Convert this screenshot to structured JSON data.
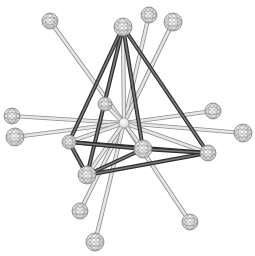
{
  "diagram": {
    "title": "",
    "colors": {
      "background": "#ffffff",
      "frame_edge": "#4a4a4a",
      "frame_edge_light": "#7a7a7a",
      "rod_fill": "#e6e6e6",
      "rod_stroke": "#8c8c8c",
      "sphere_fill": "#f4f4f4",
      "sphere_mesh": "#7d7d7d"
    },
    "center": {
      "x": 124,
      "y": 123
    },
    "frame_vertices": [
      {
        "id": "B",
        "x": 123,
        "y": 27,
        "r": 9
      },
      {
        "id": "K",
        "x": 87,
        "y": 175,
        "r": 9
      },
      {
        "id": "J",
        "x": 208,
        "y": 153,
        "r": 8
      },
      {
        "id": "I",
        "x": 143,
        "y": 149,
        "r": 9
      },
      {
        "id": "O",
        "x": 69,
        "y": 142,
        "r": 7
      }
    ],
    "frame_edges": [
      [
        "B",
        "K"
      ],
      [
        "B",
        "O"
      ],
      [
        "B",
        "J"
      ],
      [
        "B",
        "I"
      ],
      [
        "K",
        "J"
      ],
      [
        "O",
        "J"
      ],
      [
        "K",
        "O"
      ],
      [
        "O",
        "I"
      ],
      [
        "K",
        "I"
      ],
      [
        "I",
        "J"
      ]
    ],
    "radial_spheres": [
      {
        "id": "A",
        "x": 50,
        "y": 21,
        "r": 8
      },
      {
        "id": "C",
        "x": 149,
        "y": 15,
        "r": 8
      },
      {
        "id": "D",
        "x": 173,
        "y": 22,
        "r": 9
      },
      {
        "id": "E",
        "x": 12,
        "y": 116,
        "r": 8
      },
      {
        "id": "F",
        "x": 15,
        "y": 137,
        "r": 9
      },
      {
        "id": "G",
        "x": 213,
        "y": 111,
        "r": 8
      },
      {
        "id": "H",
        "x": 243,
        "y": 133,
        "r": 9
      },
      {
        "id": "L",
        "x": 80,
        "y": 211,
        "r": 8
      },
      {
        "id": "M",
        "x": 190,
        "y": 222,
        "r": 8
      },
      {
        "id": "N",
        "x": 95,
        "y": 242,
        "r": 9
      },
      {
        "id": "P",
        "x": 105,
        "y": 104,
        "r": 7
      }
    ],
    "labels": []
  }
}
